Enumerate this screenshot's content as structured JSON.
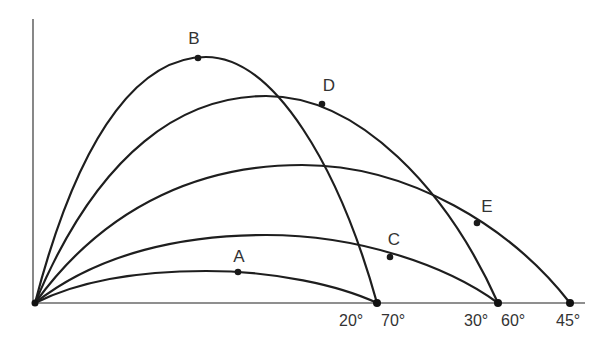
{
  "diagram": {
    "origin": {
      "x": 35,
      "y": 303
    },
    "axes": {
      "y_top": 19,
      "x_end": 585
    },
    "colors": {
      "curve": "#1e1e1e",
      "axis": "#6a6a6a",
      "text": "#333333"
    },
    "trajectories": [
      {
        "angle": "20°",
        "land_x": 377,
        "apex_x": 206,
        "apex_y": 271
      },
      {
        "angle": "30°",
        "land_x": 498,
        "apex_x": 266,
        "apex_y": 235
      },
      {
        "angle": "45°",
        "land_x": 570,
        "apex_x": 302,
        "apex_y": 165
      },
      {
        "angle": "60°",
        "land_x": 498,
        "apex_x": 266,
        "apex_y": 96
      },
      {
        "angle": "70°",
        "land_x": 377,
        "apex_x": 206,
        "apex_y": 57
      }
    ],
    "points": [
      {
        "label": "A",
        "x": 238,
        "y": 272,
        "label_x": 239,
        "label_y": 262
      },
      {
        "label": "B",
        "x": 198,
        "y": 58,
        "label_x": 194,
        "label_y": 44
      },
      {
        "label": "C",
        "x": 390,
        "y": 257,
        "label_x": 394,
        "label_y": 245
      },
      {
        "label": "D",
        "x": 322,
        "y": 104,
        "label_x": 329,
        "label_y": 91
      },
      {
        "label": "E",
        "x": 477,
        "y": 223,
        "label_x": 487,
        "label_y": 212
      }
    ],
    "angle_labels": [
      {
        "text": "20°",
        "x": 339,
        "y": 326
      },
      {
        "text": "70°",
        "x": 381,
        "y": 326
      },
      {
        "text": "30°",
        "x": 464,
        "y": 326
      },
      {
        "text": "60°",
        "x": 501,
        "y": 326
      },
      {
        "text": "45°",
        "x": 556,
        "y": 326
      }
    ]
  }
}
